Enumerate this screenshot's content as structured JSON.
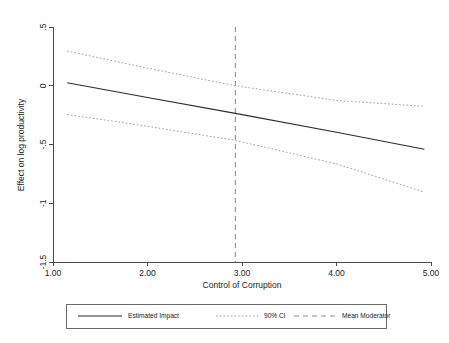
{
  "chart_data": {
    "type": "line",
    "title": "",
    "xlabel": "Control of Corruption",
    "ylabel": "Effect on log productivity",
    "xlim": [
      1.0,
      5.0
    ],
    "ylim": [
      -1.5,
      0.5
    ],
    "xticks": [
      "1.00",
      "2.00",
      "3.00",
      "4.00",
      "5.00"
    ],
    "xtick_values": [
      1.0,
      2.0,
      3.0,
      4.0,
      5.0
    ],
    "yticks": [
      ".5",
      "0",
      "-.5",
      "-1",
      "-1.5"
    ],
    "ytick_values": [
      0.5,
      0,
      -0.5,
      -1,
      -1.5
    ],
    "grid": false,
    "legend_position": "bottom-outside",
    "x": [
      1.15,
      2.0,
      2.93,
      4.0,
      4.93
    ],
    "series": [
      {
        "name": "Estimated Impact",
        "style": "solid",
        "color": "#2b2b2b",
        "values": [
          0.025,
          -0.1,
          -0.235,
          -0.395,
          -0.54
        ]
      },
      {
        "name": "90% CI Upper",
        "style": "dotted",
        "color": "#9a9a9a",
        "values": [
          0.295,
          0.15,
          0.0,
          -0.125,
          -0.175
        ]
      },
      {
        "name": "90% CI Lower",
        "style": "dotted",
        "color": "#9a9a9a",
        "values": [
          -0.245,
          -0.345,
          -0.465,
          -0.665,
          -0.905
        ]
      }
    ],
    "reference_lines": [
      {
        "name": "Mean Moderator",
        "orientation": "vertical",
        "value": 2.93,
        "style": "dashed",
        "color": "#8d8d8d"
      }
    ],
    "legend": [
      {
        "label": "Estimated Impact",
        "style": "solid",
        "color": "#2b2b2b"
      },
      {
        "label": "90% CI",
        "style": "dotted",
        "color": "#9a9a9a"
      },
      {
        "label": "Mean Moderator",
        "style": "dashed",
        "color": "#8d8d8d"
      }
    ]
  }
}
